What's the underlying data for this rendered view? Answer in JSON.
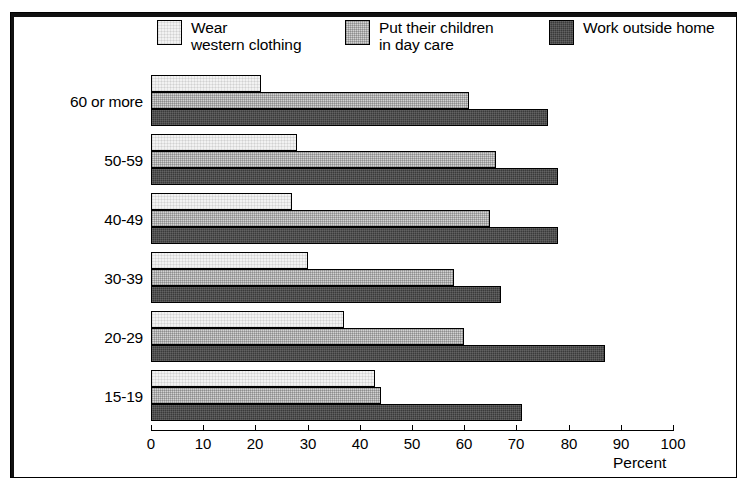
{
  "chart_data": {
    "type": "bar",
    "orientation": "horizontal",
    "title": "",
    "subtitle": "",
    "xlabel": "Percent",
    "ylabel": "",
    "xlim": [
      0,
      100
    ],
    "xticks": [
      "0",
      "10",
      "20",
      "30",
      "40",
      "50",
      "60",
      "70",
      "80",
      "90",
      "100"
    ],
    "grid": false,
    "legend_position": "top",
    "categories": [
      "60 or more",
      "50-59",
      "40-49",
      "30-39",
      "20-29",
      "15-19"
    ],
    "series": [
      {
        "name": "Wear\nwestern clothing",
        "swatch": "light",
        "color": "#f2f2f2",
        "values": [
          21,
          28,
          27,
          30,
          37,
          43
        ]
      },
      {
        "name": "Put their children\nin day care",
        "swatch": "medium",
        "color": "#d2d2d2",
        "values": [
          61,
          66,
          65,
          58,
          60,
          44
        ]
      },
      {
        "name": "Work outside home",
        "swatch": "dark",
        "color": "#3a3a3a",
        "values": [
          76,
          78,
          78,
          67,
          87,
          71
        ]
      }
    ]
  },
  "legend": {
    "items": [
      {
        "label": "Wear\nwestern clothing",
        "swatch": "light"
      },
      {
        "label": "Put their children\nin day care",
        "swatch": "medium"
      },
      {
        "label": "Work outside home",
        "swatch": "dark"
      }
    ]
  },
  "axis": {
    "percent_label": "Percent"
  },
  "colors": {
    "series_light": "#f2f2f2",
    "series_medium": "#d2d2d2",
    "series_dark": "#3a3a3a",
    "frame": "#000000",
    "background": "#ffffff"
  }
}
